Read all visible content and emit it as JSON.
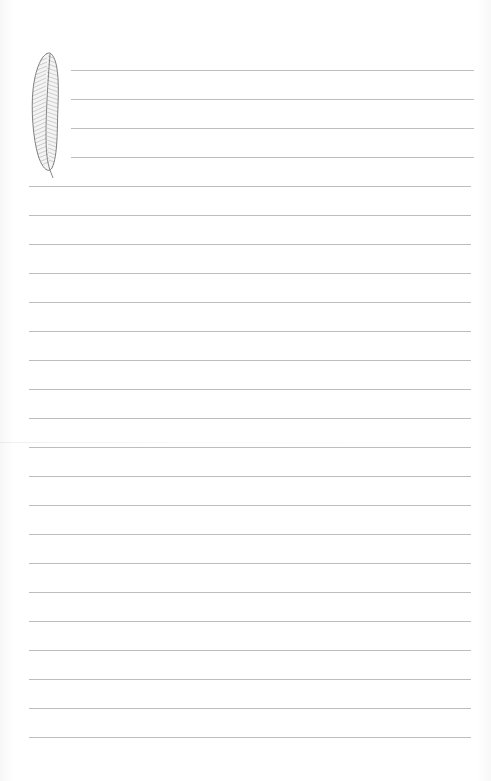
{
  "page": {
    "type": "lined-stationery",
    "background_color": "#ffffff",
    "rule_color": "#bdbdbd"
  },
  "decoration": {
    "icon": "feather-icon",
    "stroke_color": "#707070"
  },
  "short_rules": {
    "x_start": 71,
    "x_end": 474,
    "y": [
      70,
      99,
      128,
      157
    ]
  },
  "long_rules": {
    "x_start": 29,
    "x_end": 471,
    "y": [
      186,
      215,
      244,
      273,
      302,
      331,
      360,
      389,
      418,
      447,
      476,
      505,
      534,
      563,
      592,
      621,
      650,
      679,
      708,
      737
    ]
  }
}
